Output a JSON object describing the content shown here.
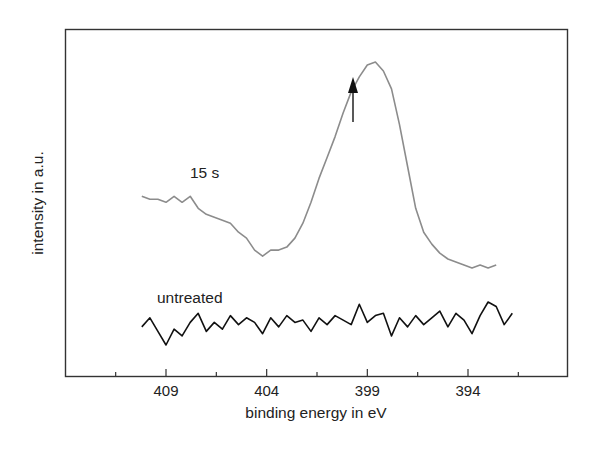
{
  "chart_data": {
    "type": "line",
    "title": "",
    "xlabel": "binding energy in eV",
    "ylabel": "intensity in a.u.",
    "xlim": [
      412,
      387
    ],
    "x_reversed": true,
    "x_ticks": [
      409,
      404,
      399,
      394
    ],
    "x_minor_ticks": [
      411.5,
      406.5,
      401.5,
      396.5,
      391.5
    ],
    "y_ticks": [],
    "grid": false,
    "legend": "inline labels",
    "annotations": [
      {
        "text": "15 s",
        "near_x": 405.5,
        "series": "15 s"
      },
      {
        "text": "untreated",
        "near_x": 406.5,
        "series": "untreated"
      },
      {
        "type": "arrow",
        "x": 398.6,
        "direction": "up",
        "note": "marks peak of 15 s spectrum"
      }
    ],
    "series": [
      {
        "name": "15 s",
        "color": "#8c8c8c",
        "x": [
          410.2,
          409.8,
          409.4,
          409.0,
          408.6,
          408.2,
          407.8,
          407.4,
          407.0,
          406.6,
          406.2,
          405.8,
          405.4,
          405.0,
          404.6,
          404.2,
          403.8,
          403.4,
          403.0,
          402.6,
          402.2,
          401.8,
          401.4,
          401.0,
          400.6,
          400.2,
          399.8,
          399.4,
          399.0,
          398.6,
          398.2,
          397.8,
          397.4,
          397.0,
          396.6,
          396.2,
          395.8,
          395.4,
          395.0,
          394.6,
          394.2,
          393.8,
          393.4,
          393.0,
          392.6
        ],
        "values": [
          0.62,
          0.61,
          0.61,
          0.6,
          0.62,
          0.6,
          0.62,
          0.58,
          0.56,
          0.55,
          0.54,
          0.53,
          0.5,
          0.48,
          0.44,
          0.42,
          0.44,
          0.44,
          0.45,
          0.48,
          0.53,
          0.6,
          0.68,
          0.75,
          0.82,
          0.9,
          0.97,
          1.02,
          1.06,
          1.07,
          1.04,
          0.98,
          0.86,
          0.72,
          0.58,
          0.5,
          0.46,
          0.43,
          0.41,
          0.4,
          0.39,
          0.38,
          0.39,
          0.38,
          0.39
        ]
      },
      {
        "name": "untreated",
        "color": "#111111",
        "x": [
          410.2,
          409.8,
          409.4,
          409.0,
          408.6,
          408.2,
          407.8,
          407.4,
          407.0,
          406.6,
          406.2,
          405.8,
          405.4,
          405.0,
          404.6,
          404.2,
          403.8,
          403.4,
          403.0,
          402.6,
          402.2,
          401.8,
          401.4,
          401.0,
          400.6,
          400.2,
          399.8,
          399.4,
          399.0,
          398.6,
          398.2,
          397.8,
          397.4,
          397.0,
          396.6,
          396.2,
          395.8,
          395.4,
          395.0,
          394.6,
          394.2,
          393.8,
          393.4,
          393.0,
          392.6,
          392.2,
          391.8
        ],
        "values": [
          0.08,
          0.12,
          0.06,
          0.0,
          0.07,
          0.04,
          0.1,
          0.14,
          0.06,
          0.1,
          0.07,
          0.13,
          0.09,
          0.12,
          0.1,
          0.05,
          0.12,
          0.08,
          0.13,
          0.1,
          0.11,
          0.06,
          0.12,
          0.09,
          0.13,
          0.11,
          0.09,
          0.18,
          0.1,
          0.13,
          0.14,
          0.04,
          0.12,
          0.08,
          0.13,
          0.09,
          0.12,
          0.15,
          0.08,
          0.14,
          0.11,
          0.05,
          0.13,
          0.19,
          0.17,
          0.09,
          0.14
        ]
      }
    ]
  }
}
